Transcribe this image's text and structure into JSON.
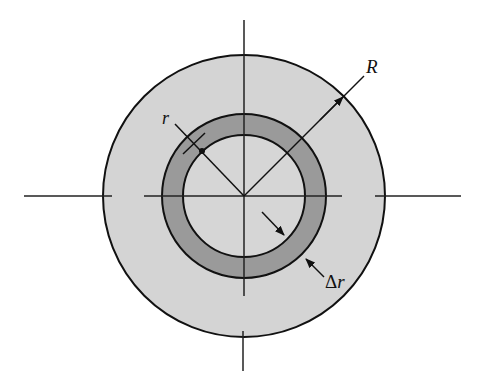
{
  "diagram": {
    "type": "concentric-circles-cross-section",
    "labels": {
      "outer_radius": "R",
      "inner_radius": "r",
      "ring_thickness_delta": "Δ",
      "ring_thickness_var": "r"
    },
    "colors": {
      "background": "#ffffff",
      "outer_disk_fill": "#d4d4d4",
      "ring_fill": "#9a9a9a",
      "inner_disk_fill": "#d6d6d6",
      "stroke": "#111111"
    },
    "geometry": {
      "center": [
        244,
        196
      ],
      "outer_radius_px": 141,
      "ring_outer_radius_px": 82,
      "ring_inner_radius_px": 61
    }
  }
}
